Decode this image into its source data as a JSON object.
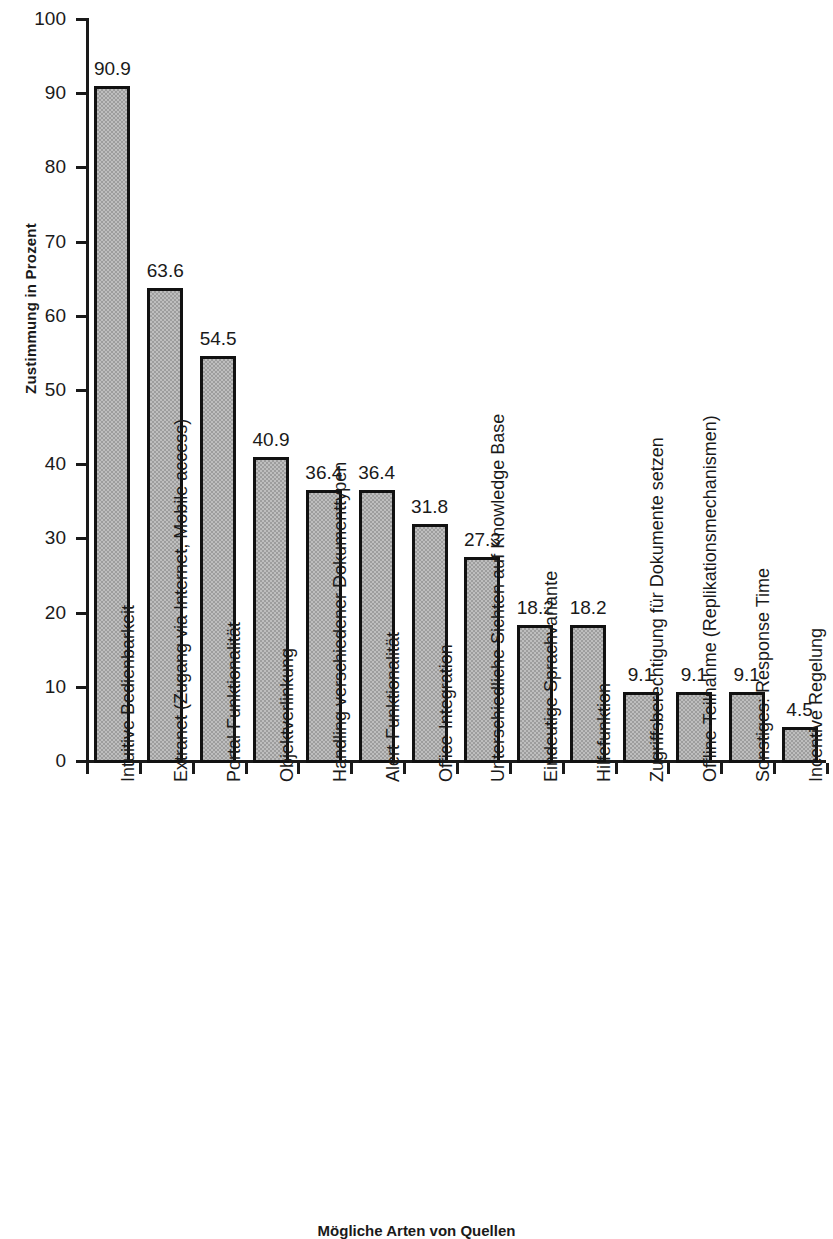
{
  "chart_data": {
    "type": "bar",
    "title": "",
    "xlabel": "Mögliche Arten von Quellen",
    "ylabel": "Zustimmung in Prozent",
    "ylim": [
      0,
      100
    ],
    "yticks": [
      0,
      10,
      20,
      30,
      40,
      50,
      60,
      70,
      80,
      90,
      100
    ],
    "ytick_labels": [
      "0",
      "10",
      "20",
      "30",
      "40",
      "50",
      "60",
      "70",
      "80",
      "90",
      "100"
    ],
    "grid": false,
    "legend": null,
    "bar_color": "#9d9d9d",
    "bar_edge_color": "#111111",
    "categories": [
      "Intuitive Bedienbarkeit",
      "Extranet (Zugang via Internet, Mobile access)",
      "Portal-Funktionalität",
      "Objektverlinkung",
      "Handling verschiedener Dokumenttypen",
      "Alert-Funktionalität",
      "Office-Integration",
      "Unterschiedliche Sichten auf Knowledge Base",
      "Eindeutige Sprachvariante",
      "Hilfefunktion",
      "Zugriffsberechtigung für Dokumente setzen",
      "Offline-Teilnahme (Replikationsmechanismen)",
      "Sonstiges: Response Time",
      "Incentive Regelung"
    ],
    "values": [
      90.9,
      63.6,
      54.5,
      40.9,
      36.4,
      36.4,
      31.8,
      27.3,
      18.2,
      18.2,
      9.1,
      9.1,
      9.1,
      4.5
    ],
    "value_labels": [
      "90.9",
      "63.6",
      "54.5",
      "40.9",
      "36.4",
      "36.4",
      "31.8",
      "27.3",
      "18.2",
      "18.2",
      "9.1",
      "9.1",
      "9.1",
      "4.5"
    ]
  }
}
